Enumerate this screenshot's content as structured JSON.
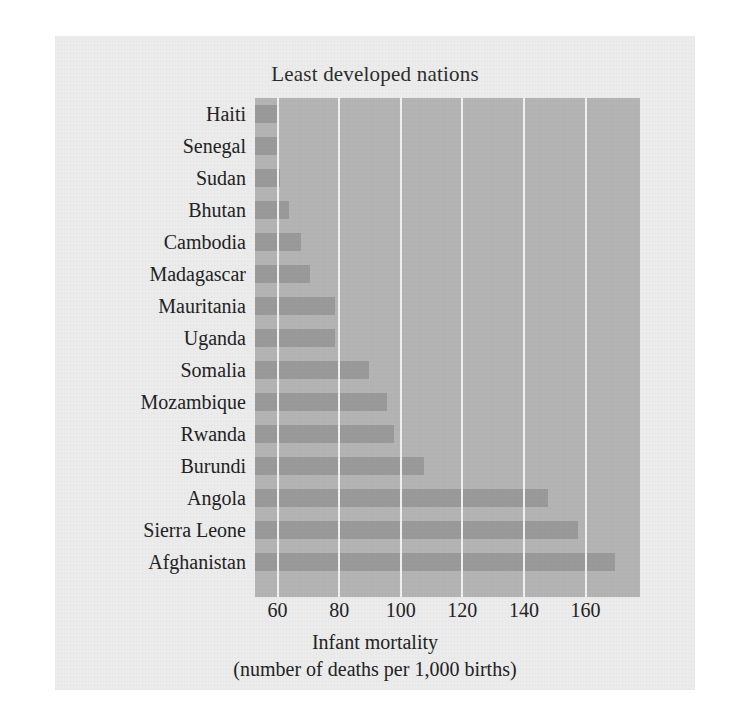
{
  "chart_data": {
    "type": "bar",
    "orientation": "horizontal",
    "title": "Least developed nations",
    "xlabel": "Infant mortality",
    "xlabel_line2": "(number of deaths per 1,000 births)",
    "ylabel": "",
    "categories": [
      "Haiti",
      "Senegal",
      "Sudan",
      "Bhutan",
      "Cambodia",
      "Madagascar",
      "Mauritania",
      "Uganda",
      "Somalia",
      "Mozambique",
      "Rwanda",
      "Burundi",
      "Angola",
      "Sierra Leone",
      "Afghanistan"
    ],
    "values": [
      60,
      60,
      61,
      64,
      68,
      71,
      79,
      79,
      90,
      96,
      98,
      108,
      148,
      158,
      170
    ],
    "xticks": [
      60,
      80,
      100,
      120,
      140,
      160
    ],
    "xticklabels": [
      "60",
      "80",
      "100",
      "120",
      "140",
      "160"
    ],
    "xlim": [
      53,
      178
    ],
    "grid": true,
    "legend": false,
    "bar_color": "#9a9a9b",
    "plot_background": "#b4b4b5",
    "gridline_color": "#f1f1f1",
    "panel_background": "#ececed",
    "text_color": "#222222"
  }
}
